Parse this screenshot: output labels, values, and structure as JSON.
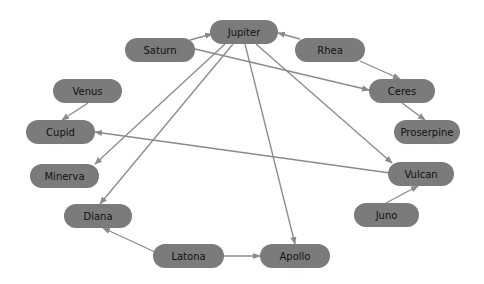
{
  "diagram": {
    "type": "directed-graph",
    "node_color": "#7b7b7b",
    "edge_color": "#8a8a8a",
    "text_color": "#111111",
    "nodes": [
      {
        "id": "jupiter",
        "label": "Jupiter",
        "x": 210,
        "y": 20,
        "w": 68,
        "h": 24
      },
      {
        "id": "saturn",
        "label": "Saturn",
        "x": 125,
        "y": 38,
        "w": 70,
        "h": 24
      },
      {
        "id": "rhea",
        "label": "Rhea",
        "x": 295,
        "y": 38,
        "w": 70,
        "h": 24
      },
      {
        "id": "venus",
        "label": "Venus",
        "x": 53,
        "y": 79,
        "w": 69,
        "h": 24
      },
      {
        "id": "ceres",
        "label": "Ceres",
        "x": 369,
        "y": 79,
        "w": 66,
        "h": 24
      },
      {
        "id": "cupid",
        "label": "Cupid",
        "x": 26,
        "y": 120,
        "w": 69,
        "h": 24
      },
      {
        "id": "proserpine",
        "label": "Proserpine",
        "x": 394,
        "y": 120,
        "w": 66,
        "h": 24
      },
      {
        "id": "minerva",
        "label": "Minerva",
        "x": 30,
        "y": 164,
        "w": 69,
        "h": 24
      },
      {
        "id": "vulcan",
        "label": "Vulcan",
        "x": 388,
        "y": 162,
        "w": 66,
        "h": 24
      },
      {
        "id": "diana",
        "label": "Diana",
        "x": 64,
        "y": 204,
        "w": 68,
        "h": 24
      },
      {
        "id": "juno",
        "label": "Juno",
        "x": 354,
        "y": 203,
        "w": 65,
        "h": 24
      },
      {
        "id": "latona",
        "label": "Latona",
        "x": 153,
        "y": 244,
        "w": 71,
        "h": 24
      },
      {
        "id": "apollo",
        "label": "Apollo",
        "x": 260,
        "y": 244,
        "w": 70,
        "h": 24
      }
    ],
    "edges": [
      {
        "from": "saturn",
        "to": "jupiter",
        "x1": 190,
        "y1": 40,
        "x2": 212,
        "y2": 34
      },
      {
        "from": "rhea",
        "to": "jupiter",
        "x1": 300,
        "y1": 39,
        "x2": 278,
        "y2": 33
      },
      {
        "from": "saturn",
        "to": "ceres",
        "x1": 195,
        "y1": 49,
        "x2": 369,
        "y2": 90
      },
      {
        "from": "rhea",
        "to": "ceres",
        "x1": 360,
        "y1": 61,
        "x2": 400,
        "y2": 79
      },
      {
        "from": "ceres",
        "to": "proserpine",
        "x1": 402,
        "y1": 103,
        "x2": 425,
        "y2": 120
      },
      {
        "from": "venus",
        "to": "cupid",
        "x1": 88,
        "y1": 103,
        "x2": 62,
        "y2": 120
      },
      {
        "from": "vulcan",
        "to": "cupid",
        "x1": 390,
        "y1": 173,
        "x2": 95,
        "y2": 132
      },
      {
        "from": "jupiter",
        "to": "minerva",
        "x1": 225,
        "y1": 44,
        "x2": 95,
        "y2": 164
      },
      {
        "from": "jupiter",
        "to": "diana",
        "x1": 233,
        "y1": 44,
        "x2": 100,
        "y2": 204
      },
      {
        "from": "jupiter",
        "to": "apollo",
        "x1": 245,
        "y1": 44,
        "x2": 295,
        "y2": 244
      },
      {
        "from": "jupiter",
        "to": "vulcan",
        "x1": 256,
        "y1": 44,
        "x2": 392,
        "y2": 163
      },
      {
        "from": "latona",
        "to": "diana",
        "x1": 155,
        "y1": 252,
        "x2": 103,
        "y2": 228
      },
      {
        "from": "latona",
        "to": "apollo",
        "x1": 224,
        "y1": 256,
        "x2": 260,
        "y2": 256
      },
      {
        "from": "juno",
        "to": "vulcan",
        "x1": 386,
        "y1": 203,
        "x2": 418,
        "y2": 186
      }
    ]
  }
}
